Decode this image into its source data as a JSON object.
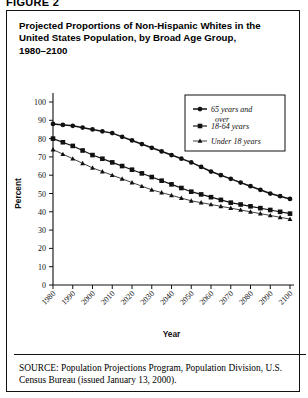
{
  "figure_label": "FIGURE 2",
  "title": "Projected Proportions of Non-Hispanic Whites in the United States Population, by Broad Age Group, 1980–2100",
  "title_lines": [
    "Projected Proportions of Non-Hispanic Whites in the",
    "United States Population, by Broad Age Group,",
    "1980–2100"
  ],
  "source": {
    "label": "SOURCE:",
    "text": "Population Projections Program, Population Division, U.S. Census Bureau (issued January 13, 2000).",
    "lines": [
      "Population Projections Program, Population Division,",
      "U.S. Census Bureau (issued January 13, 2000)."
    ]
  },
  "legend": {
    "position": "top-right",
    "entries": [
      {
        "label": "65 years and over",
        "label_lines": [
          "65 years and",
          "over"
        ],
        "marker": "circle"
      },
      {
        "label": "18-64 years",
        "label_lines": [
          "18-64 years"
        ],
        "marker": "square"
      },
      {
        "label": "Under 18 years",
        "label_lines": [
          "Under 18 years"
        ],
        "marker": "triangle"
      }
    ]
  },
  "chart_data": {
    "type": "line",
    "title": "Projected Proportions of Non-Hispanic Whites in the United States Population, by Broad Age Group, 1980–2100",
    "xlabel": "Year",
    "ylabel": "Percent",
    "xlim": [
      1980,
      2100
    ],
    "ylim": [
      0,
      100
    ],
    "ytick_step": 10,
    "yticks": [
      0,
      10,
      20,
      30,
      40,
      50,
      60,
      70,
      80,
      90,
      100
    ],
    "xticks": [
      1980,
      1990,
      2000,
      2010,
      2020,
      2030,
      2040,
      2050,
      2060,
      2070,
      2080,
      2090,
      2100
    ],
    "xtick_labels": [
      "1980",
      "1990",
      "2000",
      "2010",
      "2020",
      "2030",
      "2040",
      "2050",
      "2060",
      "2070",
      "2080",
      "2090",
      "2100"
    ],
    "grid": false,
    "legend_position": "top-right",
    "x": [
      1980,
      1990,
      2000,
      2010,
      2020,
      2030,
      2040,
      2050,
      2060,
      2070,
      2080,
      2090,
      2100
    ],
    "series": [
      {
        "name": "65 years and over",
        "marker": "circle",
        "values": [
          88,
          87,
          85,
          83,
          79,
          75,
          71,
          67,
          62,
          58,
          54,
          50,
          47
        ]
      },
      {
        "name": "18-64 years",
        "marker": "square",
        "values": [
          80,
          76,
          71,
          67,
          63,
          59,
          55,
          51,
          48,
          45,
          43,
          41,
          39
        ]
      },
      {
        "name": "Under 18 years",
        "marker": "triangle",
        "values": [
          74,
          69,
          64,
          60,
          56,
          52,
          49,
          46,
          44,
          42,
          40,
          38,
          36
        ]
      }
    ]
  }
}
